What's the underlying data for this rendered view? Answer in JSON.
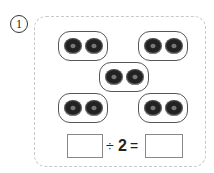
{
  "problem_number": "1",
  "groups": [
    {
      "id": "top-left",
      "items": 2
    },
    {
      "id": "top-right",
      "items": 2
    },
    {
      "id": "middle",
      "items": 2
    },
    {
      "id": "bottom-left",
      "items": 2
    },
    {
      "id": "bottom-right",
      "items": 2
    }
  ],
  "equation": {
    "divide_sign": "÷",
    "divisor": "2",
    "equals_sign": "=",
    "dividend_box": "",
    "quotient_box": ""
  }
}
